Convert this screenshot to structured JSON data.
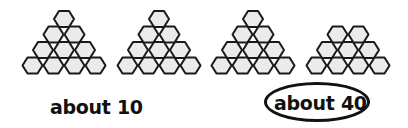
{
  "figure": {
    "hex_style": {
      "fill": "#ebebeb",
      "stroke": "#1a1a1a",
      "stroke_width": 2
    },
    "groups": [
      {
        "name": "group-1",
        "rows": [
          1,
          2,
          3,
          4
        ],
        "top_center_x": 64,
        "top_y": 19
      },
      {
        "name": "group-2",
        "rows": [
          1,
          2,
          3,
          4
        ],
        "top_center_x": 159,
        "top_y": 19
      },
      {
        "name": "group-3",
        "rows": [
          1,
          2,
          3,
          4
        ],
        "top_center_x": 253,
        "top_y": 19
      },
      {
        "name": "group-4",
        "rows": [
          2,
          3,
          4
        ],
        "top_center_x": 348,
        "top_y": 34.5
      }
    ]
  },
  "labels": {
    "left": "about 10",
    "right": "about 40",
    "right_circled": true
  }
}
